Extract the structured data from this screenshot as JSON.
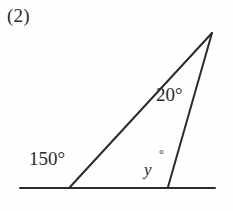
{
  "figure": {
    "index_label": "(2)",
    "type": "geometry-diagram",
    "canvas": {
      "width": 233,
      "height": 211
    },
    "background_color": "#fefefe",
    "stroke_color": "#2b2b2b",
    "angles": {
      "apex_label": "20°",
      "left_base_exterior_label": "150°",
      "unknown_variable": "y",
      "unknown_degree_symbol": "°"
    },
    "geometry": {
      "baseline": {
        "x1": 20,
        "y1": 188,
        "x2": 215,
        "y2": 188
      },
      "left_slant": {
        "x1": 70,
        "y1": 187,
        "x2": 212,
        "y2": 33
      },
      "right_slant": {
        "x1": 168,
        "y1": 187,
        "x2": 212,
        "y2": 33
      }
    }
  }
}
